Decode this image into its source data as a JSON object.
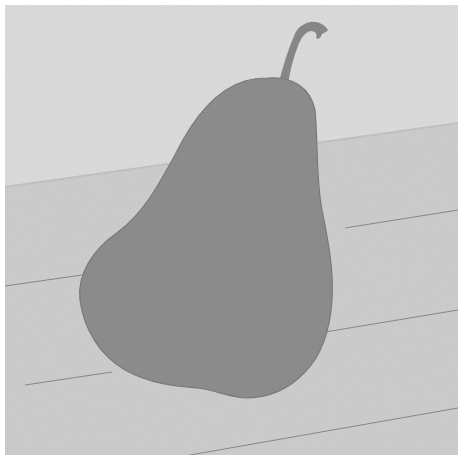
{
  "artwork": {
    "subject": "Single pear on a wooden table",
    "style": "grayscale painting",
    "colors": {
      "border": "#ffffff",
      "wall": "#dedede",
      "table": "#cfcfcf",
      "plank_line": "#8a8a8a",
      "pear": "#8f8f8f",
      "pear_shadow_edge": "#7a7a7a",
      "stem": "#8a8a8a"
    }
  }
}
